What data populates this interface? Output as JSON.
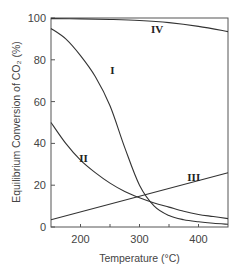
{
  "chart_data": {
    "type": "line",
    "title": "",
    "xlabel": "Temperature (°C)",
    "ylabel": "Equilibrium Conversion of CO₂ (%)",
    "xlim": [
      150,
      450
    ],
    "ylim": [
      0,
      100
    ],
    "xticks": [
      200,
      300,
      400
    ],
    "yticks": [
      0,
      20,
      40,
      60,
      80,
      100
    ],
    "grid": false,
    "legend": "inline curve labels",
    "series": [
      {
        "name": "I",
        "x": [
          150,
          175,
          200,
          225,
          250,
          275,
          300,
          325,
          350,
          375,
          400,
          425,
          450
        ],
        "values": [
          95,
          90,
          82,
          72,
          58,
          38,
          20,
          10,
          5.5,
          3.5,
          2.5,
          1.8,
          1.3
        ]
      },
      {
        "name": "II",
        "x": [
          150,
          175,
          200,
          225,
          250,
          275,
          300,
          325,
          350,
          375,
          400,
          425,
          450
        ],
        "values": [
          50,
          40,
          32,
          26,
          21,
          17,
          14,
          11.5,
          9.5,
          7.5,
          6,
          5,
          4
        ]
      },
      {
        "name": "III",
        "x": [
          150,
          450
        ],
        "values": [
          3.5,
          26
        ]
      },
      {
        "name": "IV",
        "x": [
          150,
          200,
          250,
          300,
          350,
          400,
          450
        ],
        "values": [
          99.7,
          99.6,
          99.3,
          98.8,
          97.8,
          96,
          93.5
        ]
      }
    ],
    "annotations": [
      {
        "text": "I",
        "x": 254,
        "y": 75
      },
      {
        "text": "II",
        "x": 205,
        "y": 33
      },
      {
        "text": "III",
        "x": 392,
        "y": 24
      },
      {
        "text": "IV",
        "x": 330,
        "y": 94.5
      }
    ]
  }
}
